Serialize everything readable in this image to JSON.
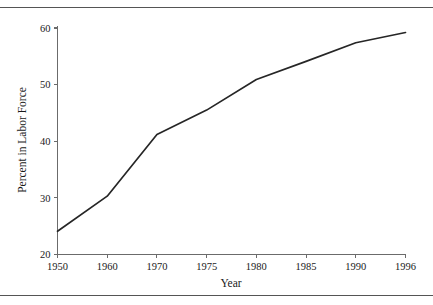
{
  "figure": {
    "background_color": "#ffffff",
    "rule_color": "#555555",
    "has_top_rule": true,
    "has_bottom_rule": true
  },
  "chart_data": {
    "type": "line",
    "title": "",
    "subtitle": "",
    "xlabel": "Year",
    "ylabel": "Percent in Labor Force",
    "x_tick_labels": [
      "1950",
      "1960",
      "1970",
      "1975",
      "1980",
      "1985",
      "1990",
      "1996"
    ],
    "categories": [
      1950,
      1960,
      1970,
      1975,
      1980,
      1985,
      1990,
      1996
    ],
    "x_axis_spacing": "categorical-even",
    "values": [
      24.1,
      30.3,
      41.2,
      45.5,
      50.9,
      54.1,
      57.4,
      59.2
    ],
    "series": [
      {
        "name": "Percent in Labor Force",
        "values": [
          24.1,
          30.3,
          41.2,
          45.5,
          50.9,
          54.1,
          57.4,
          59.2
        ],
        "color": "#262626"
      }
    ],
    "ylim": [
      20,
      60
    ],
    "y_ticks": [
      20,
      30,
      40,
      50,
      60
    ],
    "y_tick_labels": [
      "20",
      "30",
      "40",
      "50",
      "60"
    ],
    "xlim_index": [
      0,
      7
    ],
    "grid": false,
    "legend": false,
    "legend_position": "none",
    "line_color": "#262626",
    "axis_color": "#6b6b6b",
    "markers": false,
    "annotations": []
  }
}
